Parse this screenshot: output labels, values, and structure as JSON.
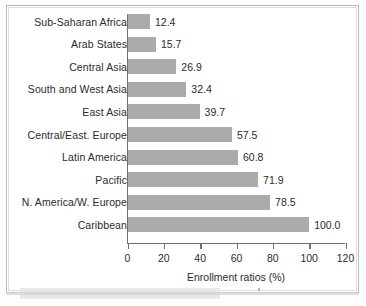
{
  "chart_data": {
    "type": "bar",
    "orientation": "horizontal",
    "title": "",
    "xlabel": "Enrollment ratios (%)",
    "ylabel": "",
    "xlim": [
      0,
      120
    ],
    "xticks": [
      0,
      20,
      40,
      60,
      80,
      100,
      120
    ],
    "grid": false,
    "legend": false,
    "categories": [
      "Sub-Saharan Africa",
      "Arab States",
      "Central Asia",
      "South and West Asia",
      "East Asia",
      "Central/East. Europe",
      "Latin America",
      "Pacific",
      "N. America/W. Europe",
      "Caribbean"
    ],
    "values": [
      12.4,
      15.7,
      26.9,
      32.4,
      39.7,
      57.5,
      60.8,
      71.9,
      78.5,
      100.0
    ],
    "value_labels": [
      "12.4",
      "15.7",
      "26.9",
      "32.4",
      "39.7",
      "57.5",
      "60.8",
      "71.9",
      "78.5",
      "100.0"
    ],
    "bar_color": "#a9abad",
    "axis_color": "#6e7073"
  }
}
